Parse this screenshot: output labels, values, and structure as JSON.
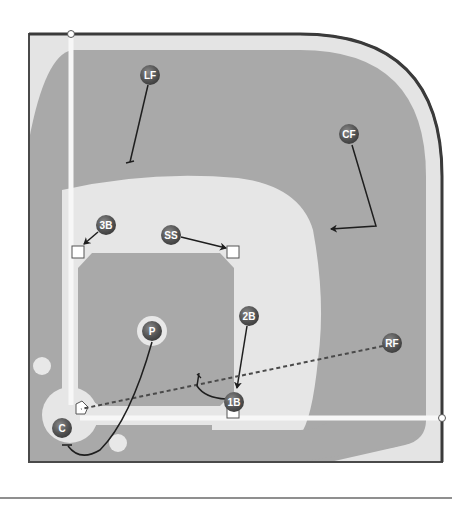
{
  "diagram": {
    "title": "",
    "colors": {
      "grass": "#a9a9a9",
      "dirt": "#e6e6e6",
      "warning_track": "#e3e3e3",
      "border": "#4a4a4a",
      "player_fill": "#5a5a5a",
      "line": "#1e1e1e",
      "chalk": "#f7f7f7"
    },
    "players": [
      {
        "id": "LF",
        "label": "LF",
        "x": 150,
        "y": 75
      },
      {
        "id": "CF",
        "label": "CF",
        "x": 349,
        "y": 134
      },
      {
        "id": "3B",
        "label": "3B",
        "x": 106,
        "y": 225
      },
      {
        "id": "SS",
        "label": "SS",
        "x": 171,
        "y": 235
      },
      {
        "id": "P",
        "label": "P",
        "x": 152,
        "y": 331
      },
      {
        "id": "2B",
        "label": "2B",
        "x": 249,
        "y": 316
      },
      {
        "id": "RF",
        "label": "RF",
        "x": 392,
        "y": 343
      },
      {
        "id": "1B",
        "label": "1B",
        "x": 234,
        "y": 402
      },
      {
        "id": "C",
        "label": "C",
        "x": 62,
        "y": 428
      }
    ],
    "bases": [
      {
        "id": "third-base",
        "x": 78,
        "y": 252
      },
      {
        "id": "second-base",
        "x": 233,
        "y": 252
      },
      {
        "id": "first-base",
        "x": 233,
        "y": 413
      }
    ],
    "home_plate": {
      "x": 81,
      "y": 409
    }
  }
}
